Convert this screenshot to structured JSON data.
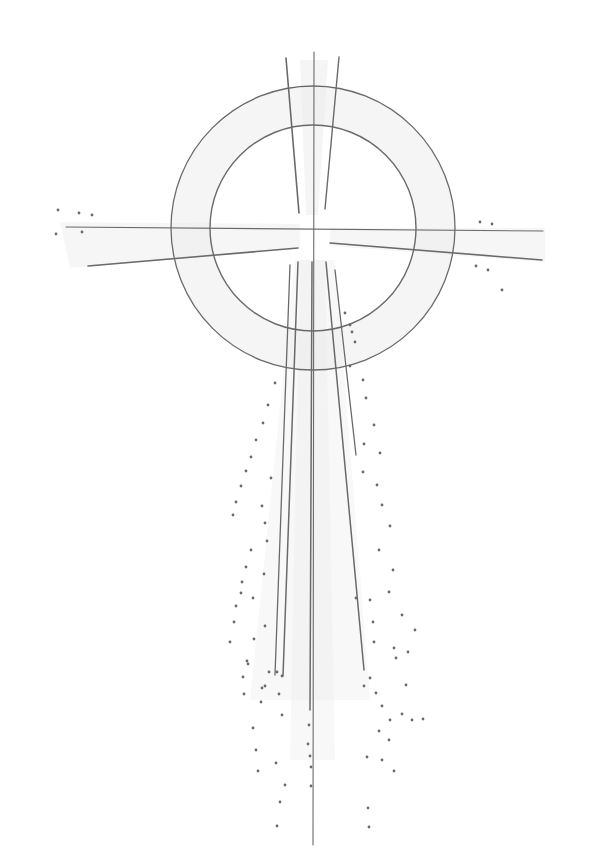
{
  "artwork": {
    "title": "Pencil drawing of a ringed cross with radiating light",
    "background": "#ffffff",
    "stroke_color": "#6a6a6a",
    "shade_color": "#ececec",
    "center": [
      313,
      228
    ],
    "rings": [
      {
        "r": 142,
        "w": 1.3
      },
      {
        "r": 103,
        "w": 1.4
      }
    ],
    "shading": [
      {
        "points": "300,60 328,60 318,215 306,215",
        "opacity": 0.55
      },
      {
        "points": "60,222 300,224 300,248 70,268",
        "opacity": 0.45
      },
      {
        "points": "330,228 545,228 545,262 330,246",
        "opacity": 0.45
      },
      {
        "points": "295,260 335,260 370,700 250,700",
        "opacity": 0.35
      },
      {
        "points": "300,260 325,260 335,760 290,760",
        "opacity": 0.35
      }
    ],
    "lines": [
      {
        "x1": 286,
        "y1": 58,
        "x2": 299,
        "y2": 213,
        "w": 1.6
      },
      {
        "x1": 314,
        "y1": 52,
        "x2": 313,
        "y2": 845,
        "w": 1.1
      },
      {
        "x1": 339,
        "y1": 57,
        "x2": 325,
        "y2": 209,
        "w": 1.4
      },
      {
        "x1": 66,
        "y1": 227,
        "x2": 543,
        "y2": 231,
        "w": 1.1
      },
      {
        "x1": 88,
        "y1": 266,
        "x2": 298,
        "y2": 248,
        "w": 1.6
      },
      {
        "x1": 330,
        "y1": 243,
        "x2": 542,
        "y2": 260,
        "w": 1.6
      },
      {
        "x1": 298,
        "y1": 262,
        "x2": 283,
        "y2": 676,
        "w": 1.5
      },
      {
        "x1": 290,
        "y1": 265,
        "x2": 275,
        "y2": 675,
        "w": 1.3
      },
      {
        "x1": 326,
        "y1": 262,
        "x2": 364,
        "y2": 670,
        "w": 1.5
      },
      {
        "x1": 335,
        "y1": 270,
        "x2": 356,
        "y2": 455,
        "w": 1.3
      },
      {
        "x1": 312,
        "y1": 262,
        "x2": 310,
        "y2": 710,
        "w": 1.5
      }
    ],
    "dots": [
      [
        58,
        210
      ],
      [
        79,
        213
      ],
      [
        92,
        215
      ],
      [
        56,
        234
      ],
      [
        82,
        232
      ],
      [
        480,
        222
      ],
      [
        492,
        224
      ],
      [
        476,
        266
      ],
      [
        488,
        270
      ],
      [
        502,
        290
      ],
      [
        345,
        313
      ],
      [
        350,
        325
      ],
      [
        352,
        332
      ],
      [
        355,
        342
      ],
      [
        350,
        366
      ],
      [
        275,
        383
      ],
      [
        268,
        405
      ],
      [
        263,
        423
      ],
      [
        256,
        440
      ],
      [
        251,
        457
      ],
      [
        246,
        471
      ],
      [
        241,
        486
      ],
      [
        236,
        502
      ],
      [
        233,
        515
      ],
      [
        271,
        478
      ],
      [
        262,
        506
      ],
      [
        265,
        523
      ],
      [
        267,
        541
      ],
      [
        251,
        550
      ],
      [
        246,
        567
      ],
      [
        264,
        574
      ],
      [
        242,
        582
      ],
      [
        241,
        593
      ],
      [
        236,
        606
      ],
      [
        234,
        622
      ],
      [
        230,
        642
      ],
      [
        253,
        598
      ],
      [
        254,
        639
      ],
      [
        265,
        626
      ],
      [
        248,
        664
      ],
      [
        282,
        676
      ],
      [
        277,
        672
      ],
      [
        247,
        661
      ],
      [
        243,
        677
      ],
      [
        244,
        694
      ],
      [
        265,
        686
      ],
      [
        269,
        672
      ],
      [
        262,
        688
      ],
      [
        261,
        702
      ],
      [
        253,
        728
      ],
      [
        256,
        750
      ],
      [
        258,
        771
      ],
      [
        279,
        694
      ],
      [
        282,
        715
      ],
      [
        276,
        763
      ],
      [
        285,
        785
      ],
      [
        280,
        802
      ],
      [
        277,
        826
      ],
      [
        309,
        725
      ],
      [
        308,
        744
      ],
      [
        310,
        756
      ],
      [
        311,
        767
      ],
      [
        311,
        786
      ],
      [
        363,
        380
      ],
      [
        366,
        398
      ],
      [
        374,
        425
      ],
      [
        364,
        444
      ],
      [
        380,
        453
      ],
      [
        363,
        472
      ],
      [
        377,
        485
      ],
      [
        382,
        505
      ],
      [
        390,
        526
      ],
      [
        379,
        550
      ],
      [
        393,
        570
      ],
      [
        370,
        600
      ],
      [
        389,
        592
      ],
      [
        402,
        615
      ],
      [
        415,
        630
      ],
      [
        356,
        598
      ],
      [
        373,
        622
      ],
      [
        374,
        642
      ],
      [
        394,
        648
      ],
      [
        408,
        652
      ],
      [
        370,
        678
      ],
      [
        364,
        686
      ],
      [
        376,
        693
      ],
      [
        382,
        706
      ],
      [
        390,
        720
      ],
      [
        402,
        714
      ],
      [
        412,
        720
      ],
      [
        379,
        731
      ],
      [
        389,
        740
      ],
      [
        367,
        757
      ],
      [
        382,
        760
      ],
      [
        394,
        771
      ],
      [
        368,
        808
      ],
      [
        369,
        827
      ],
      [
        423,
        719
      ],
      [
        396,
        658
      ],
      [
        406,
        685
      ]
    ]
  }
}
